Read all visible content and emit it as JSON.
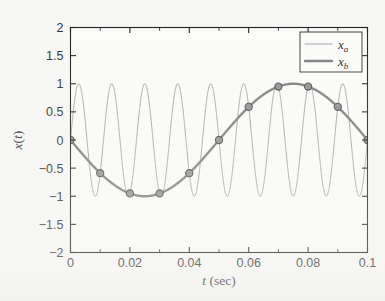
{
  "chart_data": {
    "type": "line",
    "title": "",
    "xlabel": "t (sec)",
    "xlabel_italic_part": "t",
    "xlabel_rest": " (sec)",
    "ylabel": "x(t)",
    "xlim": [
      0,
      0.1
    ],
    "ylim": [
      -2,
      2
    ],
    "xticks": [
      0,
      0.02,
      0.04,
      0.06,
      0.08,
      0.1
    ],
    "xtick_labels": [
      "0",
      "0.02",
      "0.04",
      "0.06",
      "0.08",
      "0.1"
    ],
    "xminor_step": 0.01,
    "yticks": [
      -2,
      -1.5,
      -1,
      -0.5,
      0,
      0.5,
      1,
      1.5,
      2
    ],
    "ytick_labels": [
      "-2",
      "-1.5",
      "-1",
      "-0.5",
      "0",
      "0.5",
      "1",
      "1.5",
      "2"
    ],
    "grid": false,
    "legend_position": "upper-right",
    "series": [
      {
        "name": "x_a",
        "label": "x",
        "subscript": "a",
        "kind": "continuous-sine",
        "amplitude": 1,
        "frequency_hz": 90,
        "phase": 0,
        "color": "#8a8a8a",
        "line_width": 0.8,
        "marker": "none",
        "description": "High-frequency 90 Hz sine, amplitude 1, sampled alias of x_b"
      },
      {
        "name": "x_b",
        "label": "x",
        "subscript": "b",
        "kind": "sampled-sine",
        "amplitude": 1,
        "frequency_hz": 10,
        "phase": 180,
        "color": "#7d7d7d",
        "line_width": 2.4,
        "marker": "circle",
        "marker_size": 6,
        "marker_color": "#8f8f8f",
        "marker_edge_color": "#4a4a4a",
        "description": "Low-frequency 10 Hz sine (negative sine), amplitude 1, with sample markers every 0.01 s",
        "sample_points": [
          {
            "t": 0.0,
            "x": 0.0
          },
          {
            "t": 0.01,
            "x": -0.59
          },
          {
            "t": 0.02,
            "x": -0.95
          },
          {
            "t": 0.03,
            "x": -0.95
          },
          {
            "t": 0.04,
            "x": -0.59
          },
          {
            "t": 0.05,
            "x": 0.0
          },
          {
            "t": 0.06,
            "x": 0.59
          },
          {
            "t": 0.07,
            "x": 0.95
          },
          {
            "t": 0.08,
            "x": 0.95
          },
          {
            "t": 0.09,
            "x": 0.59
          },
          {
            "t": 0.1,
            "x": 0.0
          }
        ]
      }
    ]
  },
  "style": {
    "background": "#f7f7f5",
    "axis_color": "#1c1c1c",
    "text_color": "#202020",
    "thin_line_color": "#8a8a8a",
    "thick_line_color": "#7d7d7d",
    "marker_fill": "#8f8f8f",
    "marker_edge": "#4a4a4a",
    "legend_border": "#3a3a3a",
    "legend_background": "#fbfbfa"
  }
}
